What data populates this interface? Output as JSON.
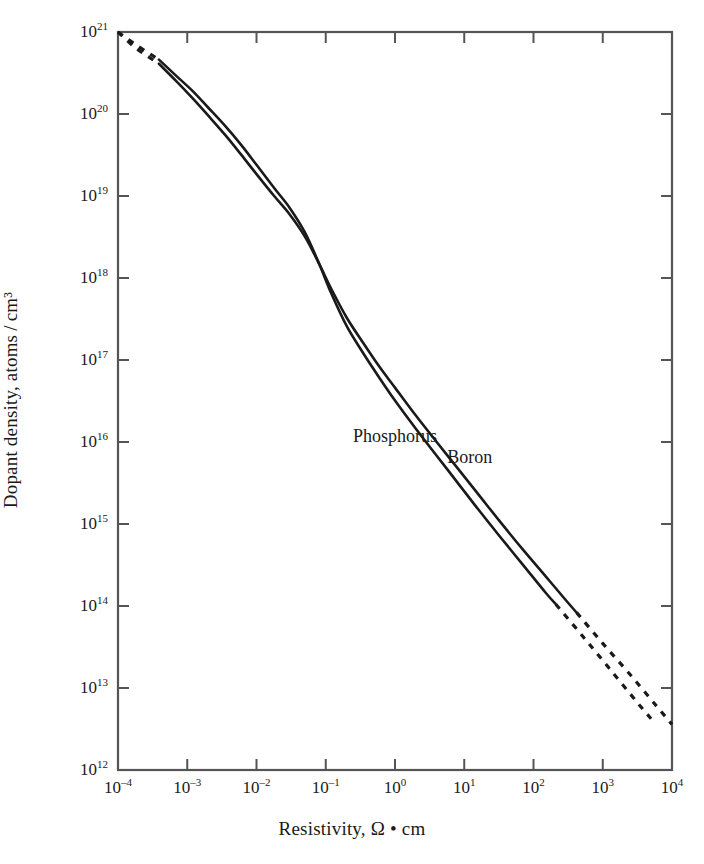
{
  "chart_data": {
    "type": "line",
    "title": "",
    "subtitle": "",
    "xlabel": "Resistivity, Ω • cm",
    "ylabel": "Dopant density, atoms / cm³",
    "xscale": "log",
    "yscale": "log",
    "xlim": [
      0.0001,
      10000
    ],
    "ylim": [
      1000000000000.0,
      1e+21
    ],
    "grid": false,
    "legend_position": "inline-annotations",
    "xtick_labels": [
      "10–4",
      "10–3",
      "10–2",
      "10–1",
      "10⁰",
      "10¹",
      "10²",
      "10³",
      "10⁴"
    ],
    "xtick_bases": [
      "10",
      "10",
      "10",
      "10",
      "10",
      "10",
      "10",
      "10",
      "10"
    ],
    "xtick_exponents": [
      "-4",
      "-3",
      "-2",
      "-1",
      "0",
      "1",
      "2",
      "3",
      "4"
    ],
    "xtick_values": [
      0.0001,
      0.001,
      0.01,
      0.1,
      1,
      10,
      100,
      1000,
      10000
    ],
    "ytick_bases": [
      "10",
      "10",
      "10",
      "10",
      "10",
      "10",
      "10",
      "10",
      "10",
      "10"
    ],
    "ytick_exponents": [
      "12",
      "13",
      "14",
      "15",
      "16",
      "17",
      "18",
      "19",
      "20",
      "21"
    ],
    "ytick_values": [
      1000000000000.0,
      10000000000000.0,
      100000000000000.0,
      1000000000000000.0,
      1e+16,
      1e+17,
      1e+18,
      1e+19,
      1e+20,
      1e+21
    ],
    "line_color": "#1a1a1a",
    "axis_color": "#555555",
    "background_color": "#ffffff",
    "series": [
      {
        "name": "Phosphorus",
        "label_x": 1.0,
        "label_y": 1.2e+16,
        "style": "solid-with-dashed-extrapolation",
        "solid_range_x": [
          0.00039,
          210
        ],
        "dashed_ranges_x": [
          [
            0.0001,
            0.00039
          ],
          [
            210,
            5000
          ]
        ],
        "points": [
          [
            0.0001,
            1e+21
          ],
          [
            0.00018,
            7e+20
          ],
          [
            0.00039,
            4.6e+20
          ],
          [
            0.0007,
            2.9e+20
          ],
          [
            0.0012,
            1.9e+20
          ],
          [
            0.002,
            1.2e+20
          ],
          [
            0.0035,
            7.2e+19
          ],
          [
            0.006,
            4.2e+19
          ],
          [
            0.01,
            2.4e+19
          ],
          [
            0.018,
            1.25e+19
          ],
          [
            0.03,
            7.2e+18
          ],
          [
            0.05,
            3.6e+18
          ],
          [
            0.08,
            1.5e+18
          ],
          [
            0.12,
            6.5e+17
          ],
          [
            0.2,
            2.6e+17
          ],
          [
            0.35,
            1.2e+17
          ],
          [
            0.6,
            6e+16
          ],
          [
            1.0,
            3.2e+16
          ],
          [
            2.0,
            1.45e+16
          ],
          [
            4.0,
            6800000000000000.0
          ],
          [
            8.0,
            3200000000000000.0
          ],
          [
            16.0,
            1500000000000000.0
          ],
          [
            32.0,
            720000000000000.0
          ],
          [
            70.0,
            320000000000000.0
          ],
          [
            150.0,
            145000000000000.0
          ],
          [
            210.0,
            105000000000000.0
          ],
          [
            500.0,
            44000000000000.0
          ],
          [
            1200.0,
            18000000000000.0
          ],
          [
            3000.0,
            7000000000000.0
          ],
          [
            5000.0,
            4200000000000.0
          ]
        ]
      },
      {
        "name": "Boron",
        "label_x": 12.0,
        "label_y": 6500000000000000.0,
        "style": "solid-with-dashed-extrapolation",
        "solid_range_x": [
          0.00039,
          420
        ],
        "dashed_ranges_x": [
          [
            0.0001,
            0.00039
          ],
          [
            420,
            10000
          ]
        ],
        "points": [
          [
            0.0001,
            1e+21
          ],
          [
            0.00018,
            6.4e+20
          ],
          [
            0.00039,
            4.1e+20
          ],
          [
            0.0007,
            2.5e+20
          ],
          [
            0.0012,
            1.55e+20
          ],
          [
            0.002,
            9.6e+19
          ],
          [
            0.0035,
            5.6e+19
          ],
          [
            0.006,
            3.2e+19
          ],
          [
            0.01,
            1.85e+19
          ],
          [
            0.018,
            1e+19
          ],
          [
            0.03,
            6e+18
          ],
          [
            0.05,
            3.2e+18
          ],
          [
            0.08,
            1.5e+18
          ],
          [
            0.12,
            7.4e+17
          ],
          [
            0.2,
            3.3e+17
          ],
          [
            0.35,
            1.6e+17
          ],
          [
            0.6,
            8.2e+16
          ],
          [
            1.0,
            4.6e+16
          ],
          [
            2.0,
            2.1e+16
          ],
          [
            4.0,
            1e+16
          ],
          [
            8.0,
            4800000000000000.0
          ],
          [
            16.0,
            2300000000000000.0
          ],
          [
            32.0,
            1100000000000000.0
          ],
          [
            70.0,
            490000000000000.0
          ],
          [
            150.0,
            230000000000000.0
          ],
          [
            300.0,
            115000000000000.0
          ],
          [
            420.0,
            83000000000000.0
          ],
          [
            1000.0,
            35000000000000.0
          ],
          [
            2500.0,
            14500000000000.0
          ],
          [
            6000.0,
            6000000000000.0
          ],
          [
            10000.0,
            3600000000000.0
          ]
        ]
      }
    ]
  }
}
